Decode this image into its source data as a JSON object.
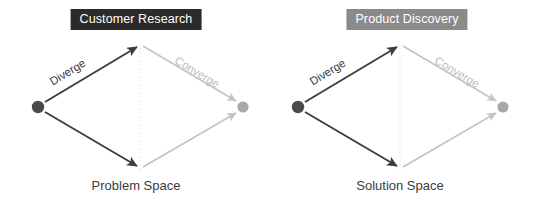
{
  "diagram": {
    "type": "double-diamond",
    "background_color": "#ffffff",
    "panels": [
      {
        "id": "customer-research",
        "badge_label": "Customer Research",
        "badge_background": "#2b2b2b",
        "badge_text_color": "#ffffff",
        "diverge_label": "Diverge",
        "converge_label": "Converge",
        "caption": "Problem Space",
        "start_dot_color": "#4a4a4a",
        "end_dot_color": "#a8a8a8",
        "diverge_line_color": "#3d3d3d",
        "converge_line_color": "#c4c4c4",
        "center_line_color": "#e2e2e2"
      },
      {
        "id": "product-discovery",
        "badge_label": "Product Discovery",
        "badge_background": "#8a8a8a",
        "badge_text_color": "#ffffff",
        "diverge_label": "Diverge",
        "converge_label": "Converge",
        "caption": "Solution Space",
        "start_dot_color": "#4a4a4a",
        "end_dot_color": "#a8a8a8",
        "diverge_line_color": "#3d3d3d",
        "converge_line_color": "#c4c4c4",
        "center_line_color": "#e2e2e2"
      }
    ]
  }
}
